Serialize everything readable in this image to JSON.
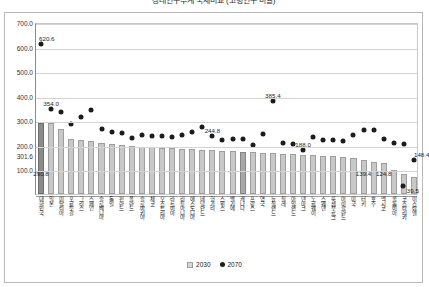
{
  "title": "장래인구추계 국제비교 (고령인구 비율)",
  "chart_data": {
    "type": "bar",
    "title": "장래인구추계 국제비교 (고령인구 비율)",
    "xlabel": "",
    "ylabel": "",
    "ylim": [
      0,
      700
    ],
    "yticks": [
      0,
      100,
      200,
      300,
      400,
      500,
      600,
      700
    ],
    "ytick_labels": [
      "0.0",
      "100.0",
      "200.0",
      "300.0",
      "400.0",
      "500.0",
      "600.0",
      "700.0"
    ],
    "grid": true,
    "legend_position": "bottom",
    "axis_extra_label": "301.6",
    "categories": [
      "대한민국",
      "일본",
      "이탈리아",
      "포르투갈",
      "그리스",
      "스페인",
      "슬로베니아",
      "독일",
      "핀란드",
      "폴란드",
      "슬로바키아",
      "체코",
      "오스트리아",
      "라트비아",
      "리투아니아",
      "에스토니아",
      "네덜란드",
      "헝가리",
      "스위스",
      "벨기에",
      "캐나다",
      "프랑스",
      "영국",
      "뉴질랜드",
      "칠레",
      "아일랜드",
      "덴마크",
      "노르웨이",
      "스웨덴",
      "룩셈부르크",
      "아이슬란드",
      "미국",
      "터키",
      "호주",
      "멕시코",
      "콜롬비아",
      "코스타리카",
      "이스라엘"
    ],
    "series": [
      {
        "name": "2030",
        "type": "bar",
        "values": [
          290.8,
          287.0,
          265.0,
          222.0,
          218.0,
          215.0,
          208.0,
          205.0,
          200.0,
          196.0,
          192.0,
          190.0,
          188.0,
          186.0,
          184.0,
          182.0,
          180.0,
          178.0,
          176.0,
          174.0,
          172.0,
          170.0,
          168.0,
          166.0,
          164.0,
          162.0,
          160.0,
          158.0,
          156.0,
          154.0,
          152.0,
          147.6,
          139.4,
          130.0,
          124.8,
          98.0,
          82.0,
          68.0
        ],
        "labels": {
          "0": "290.8",
          "32": "139.4",
          "34": "124.8"
        },
        "color": "#c8c8c8"
      },
      {
        "name": "2070",
        "type": "scatter",
        "values": [
          620.6,
          354.0,
          341.0,
          293.0,
          323.0,
          350.0,
          272.0,
          262.0,
          258.0,
          238.0,
          248.0,
          245.0,
          243.0,
          240.0,
          249.0,
          262.0,
          280.0,
          244.8,
          226.0,
          230.0,
          232.0,
          206.0,
          252.0,
          385.4,
          216.0,
          210.0,
          188.0,
          242.0,
          228.0,
          226.0,
          224.0,
          247.0,
          268.0,
          268.0,
          233.0,
          215.0,
          212.0,
          148.4
        ],
        "labels": {
          "0": "620.6",
          "1": "354.0",
          "17": "244.8",
          "23": "385.4",
          "26": "188.0",
          "37": "148.4"
        },
        "color": "#1c1c1c",
        "tail_value": 39.5,
        "tail_label": "39.5"
      }
    ],
    "legend": [
      {
        "label": "2030",
        "marker": "bar",
        "color": "#c8c8c8"
      },
      {
        "label": "2070",
        "marker": "dot",
        "color": "#1c1c1c"
      }
    ],
    "highlight_categories": [
      "대한민국",
      "한국"
    ]
  }
}
